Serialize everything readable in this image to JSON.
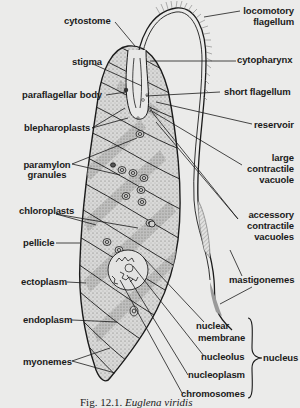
{
  "figure": {
    "caption_prefix": "Fig. 12.1.",
    "caption_species": "Euglena viridis",
    "subject": "Euglena"
  },
  "labels": {
    "locomotory_flagellum_1": "locomotory",
    "locomotory_flagellum_2": "flagellum",
    "cytostome": "cytostome",
    "cytopharynx": "cytopharynx",
    "stigma": "stigma",
    "short_flagellum": "short  flagellum",
    "paraflagellar_body": "paraflagellar body",
    "reservoir": "reservoir",
    "blepharoplasts": "blepharoplasts",
    "large_contractile_vacuole_1": "large",
    "large_contractile_vacuole_2": "contractile",
    "large_contractile_vacuole_3": "vacuole",
    "paramylon_granules_1": "paramylon",
    "paramylon_granules_2": "granules",
    "accessory_contractile_vacuoles_1": "accessory",
    "accessory_contractile_vacuoles_2": "contractile",
    "accessory_contractile_vacuoles_3": "vacuoles",
    "chloroplasts": "chloroplasts",
    "pellicle": "pellicle",
    "mastigonemes": "mastigonemes",
    "ectoplasm": "ectoplasm",
    "nuclear_membrane_1": "nuclear",
    "nuclear_membrane_2": "membrane",
    "endoplasm": "endoplasm",
    "nucleolus": "nucleolus",
    "nucleus": "nucleus",
    "nucleoplasm": "nucleoplasm",
    "myonemes": "myonemes",
    "chromosomes": "chromosomes"
  },
  "colors": {
    "ink": "#1b1b1b",
    "paper": "#ebebea",
    "stipple": "#9a9a9a"
  }
}
